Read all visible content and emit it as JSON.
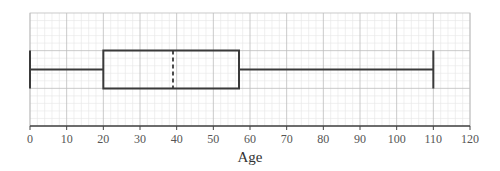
{
  "chart_data": {
    "type": "box",
    "title": "",
    "xlabel": "Age",
    "ylabel": "",
    "xlim": [
      0,
      120
    ],
    "x_ticks": [
      0,
      10,
      20,
      30,
      40,
      50,
      60,
      70,
      80,
      90,
      100,
      110,
      120
    ],
    "x_tick_labels": [
      "0",
      "10",
      "20",
      "30",
      "40",
      "50",
      "60",
      "70",
      "80",
      "90",
      "100",
      "110",
      "120"
    ],
    "grid": true,
    "orientation": "horizontal",
    "box": {
      "min": 0,
      "q1": 20,
      "median": 39,
      "q3": 57,
      "max": 110
    },
    "median_style": "dashed",
    "colors": {
      "box_stroke": "#3a3a3a",
      "major_grid": "#bdbdbd",
      "minor_grid": "#e6e6e6",
      "axis": "#444444"
    }
  }
}
